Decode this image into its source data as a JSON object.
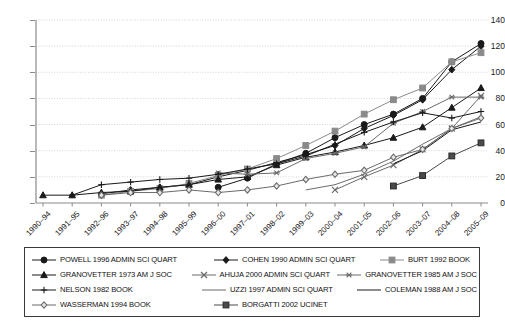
{
  "chart_data": {
    "type": "line",
    "title": "",
    "xlabel": "",
    "ylabel": "",
    "ylim": [
      0,
      140
    ],
    "ytick_values": [
      0,
      20,
      40,
      60,
      80,
      100,
      120,
      140
    ],
    "grid": true,
    "legend_position": "bottom",
    "categories": [
      "1990–94",
      "1991–95",
      "1992–96",
      "1993–97",
      "1994–98",
      "1995–99",
      "1996–00",
      "1997–01",
      "1998–02",
      "1999–03",
      "2000–04",
      "2001–05",
      "2002–06",
      "2003–07",
      "2004–08",
      "2005–09"
    ],
    "series": [
      {
        "name": "POWELL 1996 ADMIN SCI QUART",
        "marker": "filled-circle",
        "color": "#1a1a1a",
        "values": [
          null,
          null,
          null,
          null,
          null,
          null,
          12,
          19,
          30,
          38,
          50,
          60,
          68,
          80,
          108,
          122
        ]
      },
      {
        "name": "COHEN 1990 ADMIN SCI QUART",
        "marker": "filled-diamond",
        "color": "#1a1a1a",
        "values": [
          null,
          null,
          7,
          10,
          12,
          14,
          20,
          25,
          31,
          37,
          44,
          57,
          67,
          79,
          102,
          120
        ]
      },
      {
        "name": "BURT 1992 BOOK",
        "marker": "filled-square",
        "color": "#8a8a8a",
        "values": [
          null,
          null,
          6,
          9,
          11,
          15,
          21,
          26,
          34,
          44,
          55,
          68,
          79,
          88,
          108,
          115
        ]
      },
      {
        "name": "GRANOVETTER 1973 AM J SOC",
        "marker": "filled-triangle",
        "color": "#1a1a1a",
        "values": [
          6,
          6,
          8,
          9,
          12,
          14,
          18,
          20,
          29,
          35,
          39,
          44,
          50,
          58,
          73,
          88
        ]
      },
      {
        "name": "AHUJA 2000 ADMIN SCI QUART",
        "marker": "x-cross",
        "color": "#6b6b6b",
        "values": [
          null,
          null,
          null,
          null,
          null,
          null,
          null,
          null,
          null,
          null,
          10,
          20,
          29,
          41,
          57,
          82
        ]
      },
      {
        "name": "GRANOVETTER 1985 AM J SOC",
        "marker": "star-asterisk",
        "color": "#6b6b6b",
        "values": [
          null,
          null,
          null,
          null,
          null,
          null,
          23,
          22,
          23,
          34,
          38,
          43,
          61,
          70,
          81,
          81
        ]
      },
      {
        "name": "NELSON 1982 BOOK",
        "marker": "plus",
        "color": "#1a1a1a",
        "values": [
          null,
          6,
          14,
          16,
          18,
          19,
          22,
          26,
          30,
          36,
          45,
          54,
          62,
          69,
          65,
          70
        ]
      },
      {
        "name": "UZZI 1997 ADMIN SCI QUART",
        "marker": "line",
        "color": "#6b6b6b",
        "values": [
          null,
          null,
          null,
          null,
          null,
          null,
          null,
          null,
          null,
          10,
          14,
          22,
          32,
          45,
          57,
          66
        ]
      },
      {
        "name": "COLEMAN 1988 AM J SOC",
        "marker": "line",
        "color": "#1a1a1a",
        "values": [
          null,
          null,
          null,
          null,
          null,
          null,
          null,
          null,
          null,
          null,
          null,
          null,
          30,
          40,
          56,
          62
        ]
      },
      {
        "name": "WASSERMAN 1994 BOOK",
        "marker": "open-diamond",
        "color": "#6b6b6b",
        "values": [
          null,
          null,
          6,
          8,
          8,
          10,
          8,
          10,
          13,
          18,
          22,
          25,
          35,
          41,
          57,
          65
        ]
      },
      {
        "name": "BORGATTI 2002 UCINET",
        "marker": "filled-square-dark",
        "color": "#4a4a4a",
        "values": [
          null,
          null,
          null,
          null,
          null,
          null,
          null,
          null,
          null,
          null,
          null,
          null,
          13,
          21,
          36,
          46
        ]
      }
    ]
  },
  "legend": {
    "entries": [
      "POWELL 1996 ADMIN SCI QUART",
      "COHEN 1990 ADMIN SCI QUART",
      "BURT 1992 BOOK",
      "GRANOVETTER 1973 AM J SOC",
      "AHUJA 2000 ADMIN SCI QUART",
      "GRANOVETTER 1985 AM J SOC",
      "NELSON 1982 BOOK",
      "UZZI 1997 ADMIN SCI QUART",
      "COLEMAN 1988 AM J SOC",
      "WASSERMAN 1994 BOOK",
      "BORGATTI 2002 UCINET"
    ]
  },
  "colors": {
    "axis": "#8a8a8a",
    "grid": "#c9c9c9",
    "dark": "#1a1a1a",
    "mid": "#6b6b6b",
    "light": "#8a8a8a",
    "legend_border": "#3a3a3a",
    "background": "#ffffff"
  }
}
